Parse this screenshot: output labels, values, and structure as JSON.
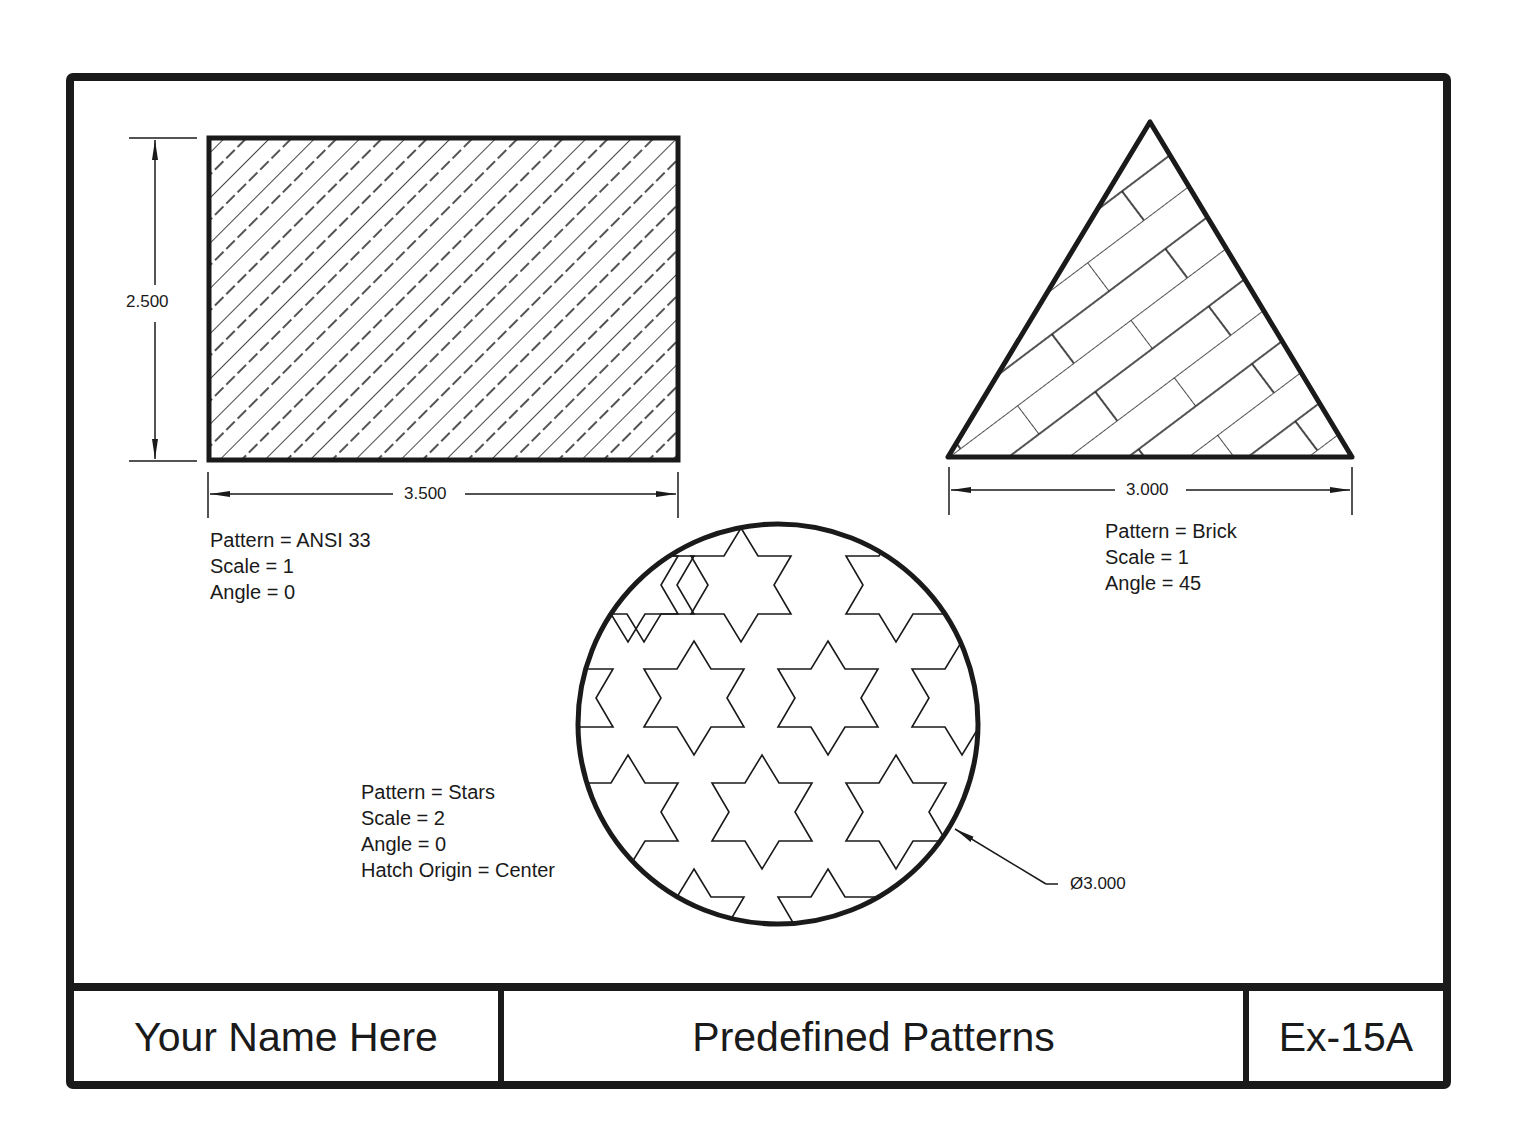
{
  "sheet": {
    "title_block": {
      "name": "Your Name Here",
      "title": "Predefined Patterns",
      "sheet_id": "Ex-15A"
    }
  },
  "rectangle": {
    "dim_height": "2.500",
    "dim_width": "3.500",
    "notes": [
      "Pattern = ANSI 33",
      "Scale = 1",
      "Angle = 0"
    ]
  },
  "triangle": {
    "dim_base": "3.000",
    "notes": [
      "Pattern = Brick",
      "Scale = 1",
      "Angle = 45"
    ]
  },
  "circle": {
    "dim_diameter": "Ø3.000",
    "notes": [
      "Pattern = Stars",
      "Scale = 2",
      "Angle = 0",
      "Hatch Origin = Center"
    ]
  },
  "colors": {
    "line": "#1a1a1a",
    "paper": "#ffffff"
  }
}
